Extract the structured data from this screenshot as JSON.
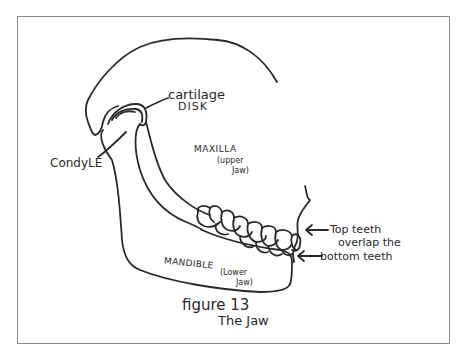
{
  "figure": {
    "number_label": "figure 13",
    "title": "The Jaw",
    "frame_border_color": "#8a8a8a",
    "ink_color": "#2a2a2a"
  },
  "labels": {
    "cartilage_line1": "cartilage",
    "cartilage_line2": "DISK",
    "condyle": "CondyLE",
    "maxilla": "MAXILLA",
    "maxilla_sub1": "(upper",
    "maxilla_sub2": "Jaw)",
    "mandible": "MANDIBLE",
    "mandible_sub1": "(Lower",
    "mandible_sub2": "Jaw)",
    "teeth_line1": "Top teeth",
    "teeth_line2": "overlap the",
    "teeth_line3": "bottom teeth"
  },
  "top_clipped_text": "· · · · · · · · · · · · · · · ·"
}
